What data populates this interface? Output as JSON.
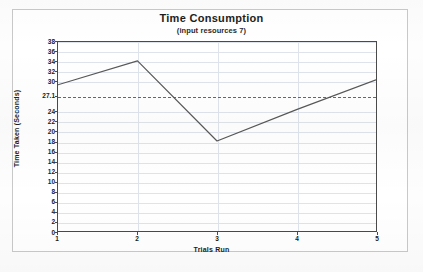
{
  "chart_data": {
    "type": "line",
    "title": "Time Consumption",
    "subtitle": "(input resources 7)",
    "xlabel": "Trials Run",
    "ylabel": "Time Taken (Seconds)",
    "x": [
      1,
      2,
      3,
      4,
      5
    ],
    "xticks": [
      "1",
      "2",
      "3",
      "4",
      "5"
    ],
    "xlim": [
      1,
      5
    ],
    "ylim": [
      0,
      38
    ],
    "yticks": [
      "0",
      "2",
      "4",
      "6",
      "8",
      "10",
      "12",
      "14",
      "16",
      "18",
      "20",
      "22",
      "24",
      "27.1",
      "30",
      "32",
      "34",
      "36",
      "38"
    ],
    "ytick_values": [
      0,
      2,
      4,
      6,
      8,
      10,
      12,
      14,
      16,
      18,
      20,
      22,
      24,
      27.1,
      30,
      32,
      34,
      36,
      38
    ],
    "series": [
      {
        "name": "Time Taken",
        "values": [
          29.4,
          34.2,
          18.1,
          24.4,
          30.4
        ],
        "color": "#585858"
      }
    ],
    "reference_line": {
      "label": "27.1",
      "value": 27.1,
      "style": "dashed",
      "color": "#5a6a86"
    },
    "grid": true,
    "legend": "none",
    "colors": {
      "axis": "#4a4a4a",
      "grid": "#dfe4ec",
      "frame": "#c9c9c9",
      "text": "#1d1d1d",
      "background": "#ffffff"
    }
  }
}
